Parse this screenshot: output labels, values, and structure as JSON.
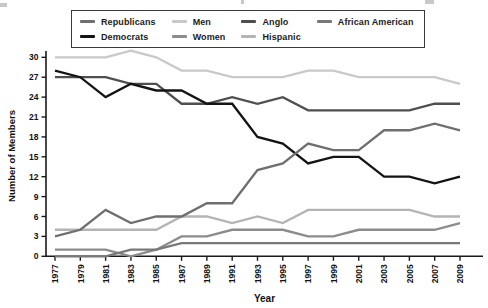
{
  "figure": {
    "y_axis_title": "Number of Members",
    "x_axis_title": "Year"
  },
  "chart_data": {
    "type": "line",
    "title": "",
    "xlabel": "Year",
    "ylabel": "Number of Members",
    "ylim": [
      0,
      30
    ],
    "yticks": [
      0,
      3,
      6,
      9,
      12,
      15,
      18,
      21,
      24,
      27,
      30
    ],
    "grid": false,
    "legend_position": "top",
    "legend_rows": 2,
    "legend_columns": 4,
    "x": [
      1977,
      1979,
      1981,
      1983,
      1985,
      1987,
      1989,
      1991,
      1993,
      1995,
      1997,
      1999,
      2001,
      2003,
      2005,
      2007,
      2009
    ],
    "series": [
      {
        "name": "Republicans",
        "color": "#6f6f6f",
        "values": [
          3,
          4,
          7,
          5,
          6,
          6,
          8,
          8,
          13,
          14,
          17,
          16,
          16,
          19,
          19,
          20,
          19
        ]
      },
      {
        "name": "Democrats",
        "color": "#141414",
        "values": [
          28,
          27,
          24,
          26,
          25,
          25,
          23,
          23,
          18,
          17,
          14,
          15,
          15,
          12,
          12,
          11,
          12
        ]
      },
      {
        "name": "Men",
        "color": "#c9c9c9",
        "values": [
          30,
          30,
          30,
          31,
          30,
          28,
          28,
          27,
          27,
          27,
          28,
          28,
          27,
          27,
          27,
          27,
          26
        ]
      },
      {
        "name": "Women",
        "color": "#8c8c8c",
        "values": [
          1,
          1,
          1,
          0,
          1,
          3,
          3,
          4,
          4,
          4,
          3,
          3,
          4,
          4,
          4,
          4,
          5
        ]
      },
      {
        "name": "Anglo",
        "color": "#4f4f4f",
        "values": [
          27,
          27,
          27,
          26,
          26,
          23,
          23,
          24,
          23,
          24,
          22,
          22,
          22,
          22,
          22,
          23,
          23
        ]
      },
      {
        "name": "Hispanic",
        "color": "#b4b4b4",
        "values": [
          4,
          4,
          4,
          4,
          4,
          6,
          6,
          5,
          6,
          5,
          7,
          7,
          7,
          7,
          7,
          6,
          6
        ]
      },
      {
        "name": "African American",
        "color": "#787878",
        "values": [
          0,
          0,
          0,
          1,
          1,
          2,
          2,
          2,
          2,
          2,
          2,
          2,
          2,
          2,
          2,
          2,
          2
        ]
      }
    ]
  }
}
